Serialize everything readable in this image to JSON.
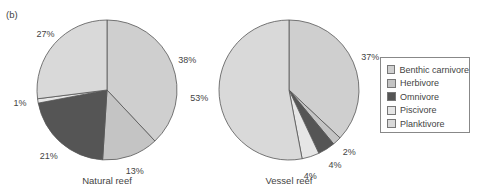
{
  "panel_label": "(b)",
  "legend": {
    "items": [
      {
        "label": "Benthic carnivore",
        "color": "#cfcfcf"
      },
      {
        "label": "Herbivore",
        "color": "#c4c4c4"
      },
      {
        "label": "Omnivore",
        "color": "#555555"
      },
      {
        "label": "Piscivore",
        "color": "#e6e6e6"
      },
      {
        "label": "Planktivore",
        "color": "#d9d9d9"
      }
    ]
  },
  "chart_data": [
    {
      "type": "pie",
      "title": "Natural reef",
      "categories": [
        "Benthic carnivore",
        "Herbivore",
        "Omnivore",
        "Piscivore",
        "Planktivore"
      ],
      "values": [
        38,
        13,
        21,
        1,
        27
      ],
      "labels": [
        "38%",
        "13%",
        "21%",
        "1%",
        "27%"
      ]
    },
    {
      "type": "pie",
      "title": "Vessel reef",
      "categories": [
        "Benthic carnivore",
        "Herbivore",
        "Omnivore",
        "Piscivore",
        "Planktivore"
      ],
      "values": [
        37,
        2,
        4,
        4,
        53
      ],
      "labels": [
        "37%",
        "2%",
        "4%",
        "4%",
        "53%"
      ]
    }
  ]
}
